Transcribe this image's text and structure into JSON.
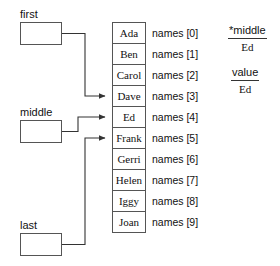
{
  "diagram": {
    "pointers": [
      {
        "name": "first",
        "label": "first",
        "target_index": 3,
        "target_value": "Dave"
      },
      {
        "name": "middle",
        "label": "middle",
        "target_index": 4,
        "target_value": "Ed"
      },
      {
        "name": "last",
        "label": "last",
        "target_index": 5,
        "target_value": "Frank"
      }
    ],
    "array": {
      "base_label": "names",
      "cells": [
        {
          "index_label": "names [0]",
          "value": "Ada"
        },
        {
          "index_label": "names [1]",
          "value": "Ben"
        },
        {
          "index_label": "names [2]",
          "value": "Carol"
        },
        {
          "index_label": "names [3]",
          "value": "Dave"
        },
        {
          "index_label": "names [4]",
          "value": "Ed"
        },
        {
          "index_label": "names [5]",
          "value": "Frank"
        },
        {
          "index_label": "names [6]",
          "value": "Gerri"
        },
        {
          "index_label": "names [7]",
          "value": "Helen"
        },
        {
          "index_label": "names [8]",
          "value": "Iggy"
        },
        {
          "index_label": "names [9]",
          "value": "Joan"
        }
      ]
    },
    "annotations": [
      {
        "expression": "*middle",
        "result": "Ed"
      },
      {
        "expression": "value",
        "result": "Ed"
      }
    ],
    "colors": {
      "stroke": "#555555",
      "text": "#111111",
      "background": "#ffffff"
    }
  }
}
